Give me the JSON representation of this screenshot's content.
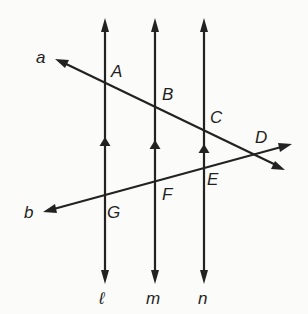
{
  "diagram": {
    "type": "parallel lines cut by transversals",
    "parallel_lines": [
      {
        "name": "ℓ",
        "x": 105
      },
      {
        "name": "m",
        "x": 155
      },
      {
        "name": "n",
        "x": 204
      }
    ],
    "transversals": [
      {
        "name": "a"
      },
      {
        "name": "b"
      }
    ],
    "points": {
      "A": "A",
      "B": "B",
      "C": "C",
      "D": "D",
      "E": "E",
      "F": "F",
      "G": "G"
    },
    "labels": {
      "line_l": "ℓ",
      "line_m": "m",
      "line_n": "n",
      "line_a": "a",
      "line_b": "b"
    },
    "parallel_marks": "single arrowhead on each of ℓ, m, n",
    "colors": {
      "line": "#222222",
      "background": "#fbfbf9"
    }
  }
}
